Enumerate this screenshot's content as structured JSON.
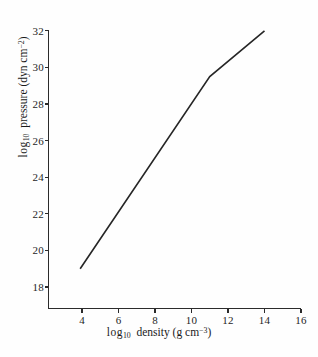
{
  "chart_data": {
    "type": "line",
    "title": "",
    "xlabel": "log10 density (g cm^-3)",
    "ylabel": "log10 pressure (dyn cm^-2)",
    "xlabel_parts": {
      "prefix": "log",
      "sub": "10",
      "mid": " density (g cm",
      "sup": "−3",
      "suffix": ")"
    },
    "ylabel_parts": {
      "prefix": "log",
      "sub": "10",
      "mid": " pressure (dyn cm",
      "sup": "−2",
      "suffix": ")"
    },
    "xlim": [
      2.1,
      16
    ],
    "ylim": [
      17.0,
      32.0
    ],
    "xticks": [
      4,
      6,
      8,
      10,
      12,
      14,
      16
    ],
    "yticks": [
      18,
      20,
      22,
      24,
      26,
      28,
      30,
      32
    ],
    "xtick_labels": [
      "4",
      "6",
      "8",
      "10",
      "12",
      "14",
      "16"
    ],
    "ytick_labels": [
      "18",
      "20",
      "22",
      "24",
      "26",
      "28",
      "30",
      "32"
    ],
    "grid": false,
    "legend": null,
    "series": [
      {
        "name": "equation of state",
        "color": "#262626",
        "x": [
          3.9,
          11.0,
          14.0
        ],
        "y": [
          19.0,
          29.5,
          32.0
        ],
        "points": [
          {
            "x": 3.9,
            "y": 19.0
          },
          {
            "x": 11.0,
            "y": 29.5
          },
          {
            "x": 14.0,
            "y": 32.0
          }
        ]
      }
    ],
    "annotations": [],
    "background_color": "#fefefe",
    "axis_color": "#2b2b2b"
  },
  "figure": {
    "caption": ""
  }
}
